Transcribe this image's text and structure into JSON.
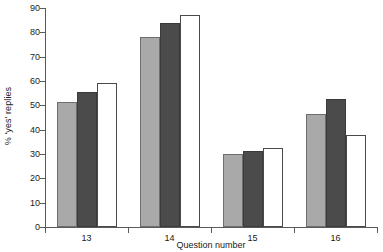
{
  "chart_data": {
    "type": "bar",
    "title": "",
    "xlabel": "Question number",
    "ylabel": "% 'yes' replies",
    "categories": [
      "13",
      "14",
      "15",
      "16"
    ],
    "ylim": [
      0,
      90
    ],
    "yticks": [
      0,
      10,
      20,
      30,
      40,
      50,
      60,
      70,
      80,
      90
    ],
    "ytick_labels": [
      "0",
      "10",
      "20",
      "30",
      "40",
      "50",
      "60",
      "70",
      "80",
      "90"
    ],
    "grid": false,
    "legend": "none",
    "series": [
      {
        "name": "series-1",
        "style": "light-gray-filled",
        "color": "#a9a9a9",
        "values": [
          51.5,
          78.0,
          30.2,
          46.5
        ]
      },
      {
        "name": "series-2",
        "style": "dark-gray-filled",
        "color": "#4b4b4b",
        "values": [
          55.3,
          83.8,
          31.4,
          52.8
        ]
      },
      {
        "name": "series-3",
        "style": "white-outlined",
        "color": "#ffffff",
        "values": [
          59.2,
          87.0,
          32.5,
          38.0
        ]
      }
    ]
  }
}
